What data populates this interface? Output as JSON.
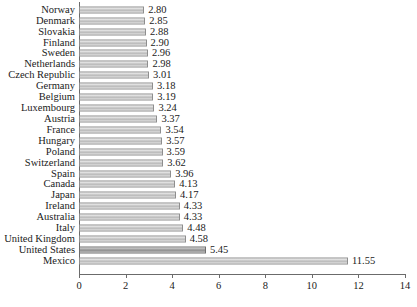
{
  "chart_data": {
    "type": "bar",
    "orientation": "horizontal",
    "title": "",
    "subtitle": "",
    "xlabel": "",
    "ylabel": "",
    "xlim": [
      0,
      14
    ],
    "ylim": null,
    "grid": false,
    "legend": null,
    "legend_position": "none",
    "xticks": [
      "0",
      "2",
      "4",
      "6",
      "8",
      "10",
      "12",
      "14"
    ],
    "xtick_values": [
      0,
      2,
      4,
      6,
      8,
      10,
      12,
      14
    ],
    "categories": [
      "Norway",
      "Denmark",
      "Slovakia",
      "Finland",
      "Sweden",
      "Netherlands",
      "Czech Republic",
      "Germany",
      "Belgium",
      "Luxembourg",
      "Austria",
      "France",
      "Hungary",
      "Poland",
      "Switzerland",
      "Spain",
      "Canada",
      "Japan",
      "Ireland",
      "Australia",
      "Italy",
      "United Kingdom",
      "United States",
      "Mexico"
    ],
    "values": [
      2.8,
      2.85,
      2.88,
      2.9,
      2.96,
      2.98,
      3.01,
      3.18,
      3.19,
      3.24,
      3.37,
      3.54,
      3.57,
      3.59,
      3.62,
      3.96,
      4.13,
      4.17,
      4.33,
      4.33,
      4.48,
      4.58,
      5.45,
      11.55
    ],
    "data_labels": [
      "2.80",
      "2.85",
      "2.88",
      "2.90",
      "2.96",
      "2.98",
      "3.01",
      "3.18",
      "3.19",
      "3.24",
      "3.37",
      "3.54",
      "3.57",
      "3.59",
      "3.62",
      "3.96",
      "4.13",
      "4.17",
      "4.33",
      "4.33",
      "4.48",
      "4.58",
      "5.45",
      "11.55"
    ],
    "highlighted_categories": [
      "United States"
    ],
    "colors": {
      "bar_fill": "#c3c3c3",
      "bar_border": "#8e8e8e",
      "bar_highlight_fill": "#9a9a9a",
      "axis": "#6b6b6b",
      "text": "#1a1a1a",
      "background": "#ffffff"
    }
  }
}
